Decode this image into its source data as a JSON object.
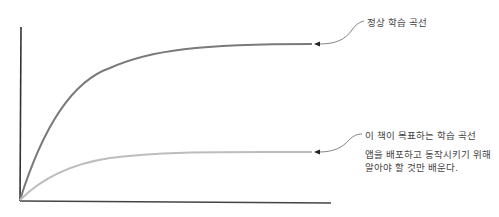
{
  "diagram": {
    "type": "learning-curve-comparison",
    "axes": {
      "x_label": "",
      "y_label": ""
    },
    "curves": [
      {
        "id": "normal",
        "label": "정상 학습 곡선",
        "color": "#7a7a7a",
        "shape": "steep rise, plateau high"
      },
      {
        "id": "book",
        "label": "이 책이 목표하는 학습 곡선",
        "description_line1": "앱을 배포하고 동작시키기 위해",
        "description_line2": "알아야 할 것만 배운다.",
        "color": "#bdbdbd",
        "shape": "gentle rise, plateau low"
      }
    ],
    "colors": {
      "axis": "#333333",
      "callout": "#555555",
      "text": "#444444"
    }
  }
}
